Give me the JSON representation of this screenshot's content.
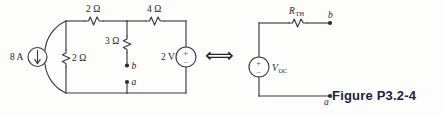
{
  "figure": {
    "caption": "Figure P3.2-4",
    "equivalence_symbol": "⟺"
  },
  "left_circuit": {
    "name": "original-circuit",
    "current_source": {
      "label": "8 A",
      "direction": "down"
    },
    "resistors": [
      {
        "id": "r-top-left",
        "label": "2 Ω",
        "orientation": "horizontal"
      },
      {
        "id": "r-top-right",
        "label": "4 Ω",
        "orientation": "horizontal"
      },
      {
        "id": "r-shunt",
        "label": "2 Ω",
        "orientation": "vertical"
      },
      {
        "id": "r-middle",
        "label": "3 Ω",
        "orientation": "vertical"
      }
    ],
    "voltage_source": {
      "label": "2 V",
      "plus": "+",
      "minus": "−"
    },
    "terminals": [
      {
        "id": "terminal-b",
        "label": "b"
      },
      {
        "id": "terminal-a",
        "label": "a"
      }
    ]
  },
  "right_circuit": {
    "name": "thevenin-equivalent",
    "resistor": {
      "id": "r-th",
      "label_main": "R",
      "label_sub": "TH"
    },
    "voltage_source": {
      "id": "v-oc",
      "label_main": "V",
      "label_sub": "OC",
      "plus": "+",
      "minus": "−"
    },
    "terminals": [
      {
        "id": "terminal-b",
        "label": "b"
      },
      {
        "id": "terminal-a",
        "label": "a"
      }
    ]
  },
  "colors": {
    "wire": "#3a3a4a",
    "text": "#23232f",
    "caption": "#1b2340",
    "background": "#fdfdfb"
  }
}
